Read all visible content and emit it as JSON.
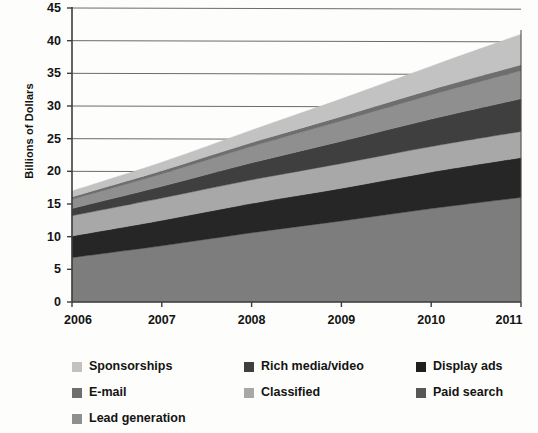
{
  "chart_data": {
    "type": "area",
    "stacked": true,
    "title": "",
    "xlabel": "",
    "ylabel": "Billions of Dollars",
    "x": [
      2006,
      2007,
      2008,
      2009,
      2010,
      2011
    ],
    "xtick_labels": [
      "2006",
      "2007",
      "2008",
      "2009",
      "2010",
      "2011"
    ],
    "ytick_labels": [
      "0",
      "5",
      "10",
      "15",
      "20",
      "25",
      "30",
      "35",
      "40",
      "45"
    ],
    "ytick_values": [
      0,
      5,
      10,
      15,
      20,
      25,
      30,
      35,
      40,
      45
    ],
    "ylim": [
      0,
      45
    ],
    "xlim": [
      2006,
      2011
    ],
    "grid": true,
    "grid_axis": "y",
    "legend_position": "bottom",
    "series": [
      {
        "name": "Paid search",
        "color": "#7d7d7d",
        "values": [
          6.8,
          8.6,
          10.6,
          12.4,
          14.3,
          16.0
        ]
      },
      {
        "name": "Display ads",
        "color": "#262626",
        "values": [
          3.3,
          3.9,
          4.5,
          5.0,
          5.6,
          6.1
        ]
      },
      {
        "name": "Classified",
        "color": "#a8a8a8",
        "values": [
          3.1,
          3.4,
          3.6,
          3.8,
          3.9,
          4.0
        ]
      },
      {
        "name": "Rich media/video",
        "color": "#3f3f3f",
        "values": [
          1.1,
          1.8,
          2.6,
          3.4,
          4.2,
          5.0
        ]
      },
      {
        "name": "Lead generation",
        "color": "#8f8f8f",
        "values": [
          1.4,
          1.9,
          2.5,
          3.1,
          3.7,
          4.3
        ]
      },
      {
        "name": "E-mail",
        "color": "#6e6e6e",
        "values": [
          0.4,
          0.5,
          0.6,
          0.7,
          0.8,
          0.9
        ]
      },
      {
        "name": "Sponsorships",
        "color": "#c2c2c2",
        "values": [
          0.9,
          1.3,
          1.9,
          2.7,
          3.6,
          4.7
        ]
      }
    ],
    "stack_totals": [
      17.0,
      21.4,
      26.3,
      31.1,
      36.1,
      41.0
    ]
  },
  "legend": {
    "items": [
      {
        "label": "Sponsorships",
        "swatch": "#c2c2c2",
        "col": 0,
        "row": 0
      },
      {
        "label": "Rich media/video",
        "swatch": "#3f3f3f",
        "col": 1,
        "row": 0
      },
      {
        "label": "Display ads",
        "swatch": "#1f1f1f",
        "col": 2,
        "row": 0
      },
      {
        "label": "E-mail",
        "swatch": "#6e6e6e",
        "col": 0,
        "row": 1
      },
      {
        "label": "Classified",
        "swatch": "#a8a8a8",
        "col": 1,
        "row": 1
      },
      {
        "label": "Paid search",
        "swatch": "#575757",
        "col": 2,
        "row": 1
      },
      {
        "label": "Lead generation",
        "swatch": "#8f8f8f",
        "col": 0,
        "row": 2
      }
    ]
  },
  "colors": {
    "axis": "#3d3d3d",
    "grid": "#6b6b6b",
    "background": "#fdfdfb",
    "text": "#141414"
  }
}
